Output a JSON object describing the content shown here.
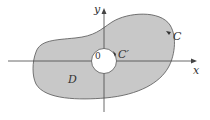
{
  "diagram": {
    "labels": {
      "y_axis": "y",
      "x_axis": "x",
      "origin": "0",
      "outer_curve": "C",
      "inner_curve": "C′",
      "region": "D"
    },
    "colors": {
      "region_fill": "#c8c8c8",
      "stroke": "#555555",
      "hole_fill": "#ffffff"
    }
  }
}
